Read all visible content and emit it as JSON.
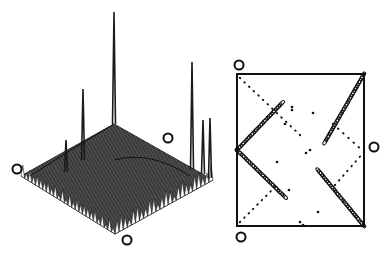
{
  "figure": {
    "type": "nmr-spectra-figure",
    "panels": [
      {
        "name": "stacked-3d-plot",
        "kind": "3d-stacked-spectrum",
        "plane_corners": {
          "top": [
            114,
            124
          ],
          "right": [
            213,
            180
          ],
          "bottom": [
            115,
            234
          ],
          "left": [
            21,
            176
          ]
        },
        "circle_markers": [
          [
            17,
            169
          ],
          [
            168,
            138
          ],
          [
            127,
            240
          ]
        ],
        "spikes": [
          {
            "x": 114,
            "base": 124,
            "peak": 12
          },
          {
            "x": 83,
            "base": 160,
            "peak": 89
          },
          {
            "x": 66,
            "base": 172,
            "peak": 140
          },
          {
            "x": 192,
            "base": 170,
            "peak": 62
          },
          {
            "x": 203,
            "base": 174,
            "peak": 120
          },
          {
            "x": 210,
            "base": 178,
            "peak": 118
          }
        ]
      },
      {
        "name": "contour-2d-plot",
        "kind": "2d-contour-map",
        "frame": {
          "x": 237,
          "y": 74,
          "width": 127,
          "height": 152
        },
        "circle_markers": [
          [
            239,
            65
          ],
          [
            374,
            147
          ],
          [
            241,
            237
          ]
        ],
        "diagonals": [
          {
            "from": [
              237,
              150
            ],
            "to": [
              282,
              103
            ],
            "style": "solid"
          },
          {
            "from": [
              237,
              150
            ],
            "to": [
              285,
              197
            ],
            "style": "solid"
          },
          {
            "from": [
              364,
              74
            ],
            "to": [
              325,
              142
            ],
            "style": "solid"
          },
          {
            "from": [
              364,
              226
            ],
            "to": [
              318,
              170
            ],
            "style": "solid"
          },
          {
            "from": [
              240,
              78
            ],
            "to": [
              300,
              135
            ],
            "style": "dotted"
          },
          {
            "from": [
              240,
              222
            ],
            "to": [
              275,
              187
            ],
            "style": "dotted"
          },
          {
            "from": [
              364,
              152
            ],
            "to": [
              333,
              124
            ],
            "style": "dotted"
          },
          {
            "from": [
              364,
              152
            ],
            "to": [
              335,
              185
            ],
            "style": "dotted"
          }
        ]
      }
    ],
    "text": []
  }
}
